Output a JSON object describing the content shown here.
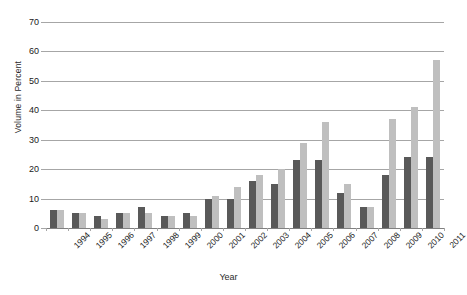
{
  "chart_data": {
    "type": "bar",
    "title": "",
    "xlabel": "Year",
    "ylabel": "Volume in Percent",
    "ylim": [
      0,
      70
    ],
    "yticks": [
      0,
      10,
      20,
      30,
      40,
      50,
      60,
      70
    ],
    "grid": true,
    "legend": "none",
    "categories": [
      "1994",
      "1995",
      "1996",
      "1997",
      "1998",
      "1999",
      "2000",
      "2001",
      "2002",
      "2003",
      "2004",
      "2005",
      "2006",
      "2007",
      "2008",
      "2009",
      "2010",
      "2011"
    ],
    "series": [
      {
        "name": "Series 1",
        "color": "#595959",
        "values": [
          6,
          5,
          4,
          5,
          7,
          4,
          5,
          10,
          10,
          16,
          15,
          23,
          23,
          12,
          7,
          18,
          24,
          24
        ]
      },
      {
        "name": "Series 2",
        "color": "#bfbfbf",
        "values": [
          6,
          5,
          3,
          5,
          5,
          4,
          4,
          11,
          14,
          18,
          20,
          29,
          36,
          15,
          7,
          37,
          41,
          57
        ]
      }
    ]
  },
  "colors": {
    "series_dark": "#595959",
    "series_light": "#bfbfbf",
    "gridline": "#a6a6a6",
    "background": "#ffffff",
    "text": "#1a1a1a"
  }
}
